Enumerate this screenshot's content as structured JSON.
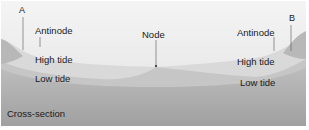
{
  "diagram": {
    "caption": "Cross-section",
    "labels": {
      "end_left": "A",
      "end_right": "B",
      "antinode_left": "Antinode",
      "antinode_right": "Antinode",
      "node": "Node",
      "high_tide_left": "High tide",
      "high_tide_right": "High tide",
      "low_tide_left": "Low tide",
      "low_tide_right": "Low tide"
    },
    "colors": {
      "sky_top": "#f2f2f2",
      "high_water": "#dcdcdc",
      "low_water": "#c4c4c4",
      "basin": "#a8a8a8",
      "line": "#3a3a3a"
    }
  }
}
